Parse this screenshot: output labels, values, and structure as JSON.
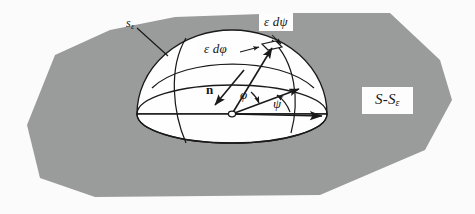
{
  "figure": {
    "background_color": "#fbfbfb",
    "region_fill_color": "#9a9b9b",
    "dome_fill_color": "#fefefe",
    "stroke_color": "#1a1a1a"
  },
  "labels": {
    "small_surface": {
      "base": "s",
      "sub": "ε",
      "full": "sε"
    },
    "d_psi": "ε dψ",
    "d_phi": "ε dφ",
    "remaining_surface": {
      "base": "S-S",
      "sub": "ε",
      "full": "S-Sε"
    },
    "normal_vector": "n",
    "polar_angle": "φ",
    "azimuth_angle": "ψ"
  },
  "geometry": {
    "region_polygon": "27,125 55,55 110,30 175,17 290,13 390,13 440,60 452,100 425,150 320,195 95,197 40,178",
    "dome": {
      "center_x": 232,
      "center_y": 114,
      "radius_x": 95,
      "radius_y": 84,
      "base_ellipse_ry": 29
    },
    "origin_point": {
      "x": 232,
      "y": 114
    },
    "arrows": [
      {
        "name": "psi-axis-arrow",
        "from": [
          232,
          114
        ],
        "to": [
          326,
          116
        ]
      },
      {
        "name": "radial-arrow",
        "from": [
          232,
          114
        ],
        "to": [
          277,
          52
        ]
      },
      {
        "name": "normal-arrow",
        "from": [
          240,
          74
        ],
        "to": [
          214,
          104
        ]
      }
    ],
    "angle_arcs": [
      {
        "name": "phi-arc",
        "label": "φ"
      },
      {
        "name": "psi-arc",
        "label": "ψ"
      }
    ]
  }
}
